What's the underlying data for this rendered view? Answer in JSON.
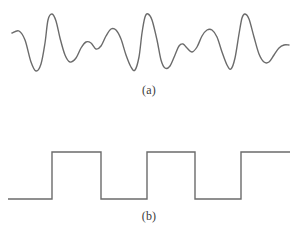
{
  "figure": {
    "background_color": "#ffffff",
    "stroke_color": "#6b6b6b",
    "stroke_width": 1.4,
    "width": 298,
    "height": 238
  },
  "panels": [
    {
      "id": "a",
      "caption": "(a)",
      "description": "analog-waveform",
      "signal_type": "analog",
      "baseline": 45,
      "x_start": 12,
      "x_end": 289
    },
    {
      "id": "b",
      "caption": "(b)",
      "description": "digital-square-wave",
      "signal_type": "digital",
      "high_level": 152,
      "low_level": 199,
      "x_start": 8,
      "x_end": 290
    }
  ],
  "chart_data": [
    {
      "type": "line",
      "id": "analog-signal",
      "title": "",
      "xlabel": "",
      "ylabel": "",
      "caption": "(a)",
      "grid": false,
      "legend": "none",
      "xlim": [
        12,
        289
      ],
      "ylim": [
        14,
        72
      ],
      "note": "continuous analog waveform with varying amplitude peaks and troughs; y is in screen pixels, smaller y = higher amplitude",
      "points": [
        [
          12,
          33
        ],
        [
          19,
          31
        ],
        [
          25,
          40
        ],
        [
          31,
          62
        ],
        [
          36,
          71
        ],
        [
          41,
          64
        ],
        [
          45,
          43
        ],
        [
          48,
          20
        ],
        [
          52,
          14
        ],
        [
          56,
          21
        ],
        [
          60,
          38
        ],
        [
          65,
          55
        ],
        [
          70,
          62
        ],
        [
          76,
          58
        ],
        [
          81,
          48
        ],
        [
          86,
          42
        ],
        [
          91,
          43
        ],
        [
          96,
          49
        ],
        [
          101,
          46
        ],
        [
          106,
          36
        ],
        [
          111,
          29
        ],
        [
          116,
          30
        ],
        [
          121,
          39
        ],
        [
          126,
          55
        ],
        [
          131,
          67
        ],
        [
          135,
          70
        ],
        [
          139,
          57
        ],
        [
          142,
          33
        ],
        [
          145,
          17
        ],
        [
          148,
          14
        ],
        [
          152,
          20
        ],
        [
          157,
          40
        ],
        [
          161,
          60
        ],
        [
          165,
          68
        ],
        [
          170,
          66
        ],
        [
          175,
          55
        ],
        [
          179,
          46
        ],
        [
          183,
          44
        ],
        [
          187,
          48
        ],
        [
          192,
          52
        ],
        [
          197,
          47
        ],
        [
          202,
          36
        ],
        [
          207,
          30
        ],
        [
          212,
          30
        ],
        [
          217,
          37
        ],
        [
          222,
          52
        ],
        [
          227,
          65
        ],
        [
          231,
          69
        ],
        [
          235,
          58
        ],
        [
          239,
          34
        ],
        [
          242,
          18
        ],
        [
          245,
          14
        ],
        [
          249,
          19
        ],
        [
          254,
          37
        ],
        [
          259,
          54
        ],
        [
          264,
          62
        ],
        [
          269,
          62
        ],
        [
          274,
          55
        ],
        [
          279,
          48
        ],
        [
          284,
          45
        ],
        [
          289,
          45
        ]
      ]
    },
    {
      "type": "line",
      "id": "digital-signal",
      "title": "",
      "xlabel": "",
      "ylabel": "",
      "caption": "(b)",
      "grid": false,
      "legend": "none",
      "xlim": [
        8,
        290
      ],
      "ylim": [
        152,
        199
      ],
      "note": "square wave; levels are screen-pixel y values. high = 152, low = 199",
      "levels": {
        "high": 152,
        "low": 199
      },
      "transitions": [
        {
          "x": 8,
          "level": "low"
        },
        {
          "x": 52,
          "level": "high"
        },
        {
          "x": 101,
          "level": "low"
        },
        {
          "x": 147,
          "level": "high"
        },
        {
          "x": 195,
          "level": "low"
        },
        {
          "x": 241,
          "level": "high"
        },
        {
          "x": 290,
          "level": "high"
        }
      ],
      "bit_sequence": [
        0,
        1,
        0,
        1,
        0,
        1
      ]
    }
  ]
}
